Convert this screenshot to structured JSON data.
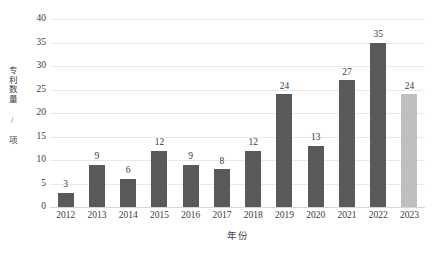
{
  "chart_data": {
    "type": "bar",
    "title": "",
    "subtitle": "",
    "xlabel": "年份",
    "ylabel": "专利数量 / 项",
    "categories": [
      "2012",
      "2013",
      "2014",
      "2015",
      "2016",
      "2017",
      "2018",
      "2019",
      "2020",
      "2021",
      "2022",
      "2023"
    ],
    "values": [
      3,
      9,
      6,
      12,
      9,
      8,
      12,
      24,
      13,
      27,
      35,
      24
    ],
    "ylim": [
      0,
      40
    ],
    "ytick_labels": [
      "40",
      "35",
      "30",
      "25",
      "20",
      "15",
      "10",
      "5",
      "0"
    ],
    "ytick_values": [
      40,
      35,
      30,
      25,
      20,
      15,
      10,
      5,
      0
    ],
    "ytick_step": 5,
    "grid": true,
    "grid_axis": "y",
    "legend": false,
    "legend_position": "none",
    "data_labels": true,
    "bar_colors": [
      "#595959",
      "#595959",
      "#595959",
      "#595959",
      "#595959",
      "#595959",
      "#595959",
      "#595959",
      "#595959",
      "#595959",
      "#595959",
      "#bfbfbf"
    ],
    "colors": {
      "bar_default": "#595959",
      "bar_highlight": "#bfbfbf",
      "gridline": "#e8e8e8",
      "baseline": "#d6d6d6",
      "text": "#3a3a3a",
      "background": "#ffffff"
    }
  }
}
